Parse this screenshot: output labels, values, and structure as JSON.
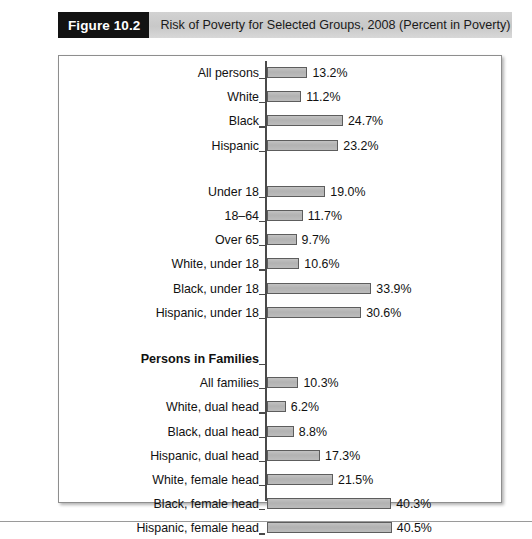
{
  "caption": {
    "figure_tag": "Figure 10.2",
    "title": "Risk of Poverty for Selected Groups, 2008 (Percent in Poverty)"
  },
  "colors": {
    "bar_fill": "#b6b6b6",
    "bar_border": "#5d5d5d",
    "tag_background": "#121212",
    "band_background": "#c8c8c8",
    "frame_border": "#8e8e8e"
  },
  "chart_data": {
    "type": "bar",
    "orientation": "horizontal",
    "title": "Risk of Poverty for Selected Groups, 2008 (Percent in Poverty)",
    "xlabel": "",
    "ylabel": "",
    "xlim": [
      0,
      42
    ],
    "grid": false,
    "legend": null,
    "value_suffix": "%",
    "categories": [
      "All persons",
      "White",
      "Black",
      "Hispanic",
      "Under 18",
      "18–64",
      "Over 65",
      "White, under 18",
      "Black, under 18",
      "Hispanic, under 18",
      "All families",
      "White, dual head",
      "Black, dual head",
      "Hispanic, dual head",
      "White, female head",
      "Black, female head",
      "Hispanic, female head"
    ],
    "values": [
      13.2,
      11.2,
      24.7,
      23.2,
      19.0,
      11.7,
      9.7,
      10.6,
      33.9,
      30.6,
      10.3,
      6.2,
      8.8,
      17.3,
      21.5,
      40.3,
      40.5
    ],
    "group_headings": [
      {
        "label": "Persons in Families",
        "before_category": "All families"
      }
    ],
    "rows": [
      {
        "label": "All persons",
        "value": 13.2,
        "display": "13.2%",
        "type": "bar",
        "group": 1
      },
      {
        "label": "White",
        "value": 11.2,
        "display": "11.2%",
        "type": "bar",
        "group": 1
      },
      {
        "label": "Black",
        "value": 24.7,
        "display": "24.7%",
        "type": "bar",
        "group": 1
      },
      {
        "label": "Hispanic",
        "value": 23.2,
        "display": "23.2%",
        "type": "bar",
        "group": 1
      },
      {
        "label": "Under 18",
        "value": 19.0,
        "display": "19.0%",
        "type": "bar",
        "group": 2
      },
      {
        "label": "18–64",
        "value": 11.7,
        "display": "11.7%",
        "type": "bar",
        "group": 2
      },
      {
        "label": "Over 65",
        "value": 9.7,
        "display": "9.7%",
        "type": "bar",
        "group": 2
      },
      {
        "label": "White, under 18",
        "value": 10.6,
        "display": "10.6%",
        "type": "bar",
        "group": 2
      },
      {
        "label": "Black, under 18",
        "value": 33.9,
        "display": "33.9%",
        "type": "bar",
        "group": 2
      },
      {
        "label": "Hispanic, under 18",
        "value": 30.6,
        "display": "30.6%",
        "type": "bar",
        "group": 2
      },
      {
        "label": "Persons in Families",
        "value": null,
        "display": "",
        "type": "heading",
        "group": 3
      },
      {
        "label": "All families",
        "value": 10.3,
        "display": "10.3%",
        "type": "bar",
        "group": 3
      },
      {
        "label": "White, dual head",
        "value": 6.2,
        "display": "6.2%",
        "type": "bar",
        "group": 3
      },
      {
        "label": "Black, dual head",
        "value": 8.8,
        "display": "8.8%",
        "type": "bar",
        "group": 3
      },
      {
        "label": "Hispanic, dual head",
        "value": 17.3,
        "display": "17.3%",
        "type": "bar",
        "group": 3
      },
      {
        "label": "White, female head",
        "value": 21.5,
        "display": "21.5%",
        "type": "bar",
        "group": 3
      },
      {
        "label": "Black, female head",
        "value": 40.3,
        "display": "40.3%",
        "type": "bar",
        "group": 3
      },
      {
        "label": "Hispanic, female head",
        "value": 40.5,
        "display": "40.5%",
        "type": "bar",
        "group": 3
      }
    ]
  }
}
